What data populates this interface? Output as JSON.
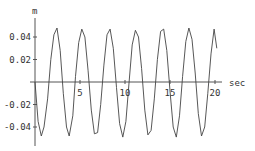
{
  "chart_data": {
    "type": "line",
    "title": "",
    "xlabel": "sec",
    "ylabel": "m",
    "xlim": [
      0,
      20.5
    ],
    "ylim": [
      -0.05,
      0.05
    ],
    "xticks": [
      5,
      10,
      15,
      20
    ],
    "yticks": [
      0.04,
      0.02,
      -0.02,
      -0.04
    ],
    "xtick_labels": [
      "5",
      "10",
      "15",
      "20"
    ],
    "ytick_labels": [
      "0.04",
      "0.02",
      "-0.02",
      "-0.04"
    ],
    "grid": false,
    "legend": null,
    "series": [
      {
        "name": "displacement",
        "color": "#444444",
        "description": "approximately sinusoidal oscillation, amplitude ~0.048 m, period ~2.75 s, starting at 0 and going negative",
        "x": [
          0,
          0.35,
          0.7,
          1.0,
          1.4,
          1.75,
          2.1,
          2.45,
          2.8,
          3.15,
          3.5,
          3.8,
          4.2,
          4.5,
          4.85,
          5.2,
          5.55,
          5.9,
          6.25,
          6.6,
          6.95,
          7.3,
          7.65,
          8.0,
          8.35,
          8.7,
          9.05,
          9.4,
          9.75,
          10.1,
          10.45,
          10.8,
          11.15,
          11.5,
          11.85,
          12.2,
          12.55,
          12.9,
          13.25,
          13.6,
          13.95,
          14.3,
          14.65,
          15.0,
          15.35,
          15.7,
          16.05,
          16.4,
          16.75,
          17.1,
          17.45,
          17.8,
          18.15,
          18.5,
          18.85,
          19.2,
          19.55,
          19.9,
          20.2
        ],
        "y": [
          0,
          -0.035,
          -0.048,
          -0.04,
          -0.015,
          0.02,
          0.042,
          0.048,
          0.028,
          -0.01,
          -0.04,
          -0.048,
          -0.03,
          0.005,
          0.035,
          0.047,
          0.04,
          0.01,
          -0.025,
          -0.046,
          -0.045,
          -0.02,
          0.015,
          0.042,
          0.047,
          0.03,
          -0.005,
          -0.037,
          -0.049,
          -0.035,
          0.0,
          0.033,
          0.046,
          0.04,
          0.012,
          -0.025,
          -0.047,
          -0.043,
          -0.015,
          0.02,
          0.045,
          0.047,
          0.028,
          -0.008,
          -0.04,
          -0.049,
          -0.03,
          0.005,
          0.036,
          0.048,
          0.038,
          0.008,
          -0.028,
          -0.048,
          -0.04,
          -0.01,
          0.025,
          0.047,
          0.03
        ]
      }
    ]
  }
}
